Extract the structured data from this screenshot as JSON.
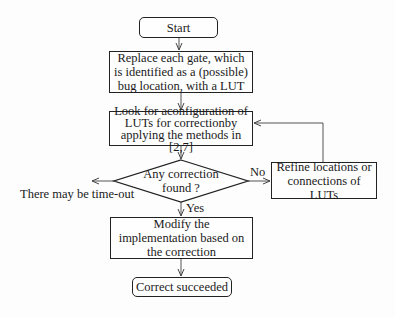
{
  "nodes": {
    "start": {
      "label": "Start",
      "shape": "rounded-rect"
    },
    "replace": {
      "label": "Replace each gate, which is identified as a (possible) bug location, with a LUT",
      "shape": "rect"
    },
    "look": {
      "label": "Look for aconfiguration of LUTs for correctionby applying the methods in [2,7]",
      "shape": "rect"
    },
    "decision": {
      "label": "Any correction found ?",
      "shape": "diamond"
    },
    "refine": {
      "label": "Refine locations or connections of LUTs",
      "shape": "rect"
    },
    "modify": {
      "label": "Modify the implementation based on the correction",
      "shape": "rect"
    },
    "end": {
      "label": "Correct succeeded",
      "shape": "rounded-rect"
    }
  },
  "edge_labels": {
    "no": "No",
    "yes": "Yes",
    "timeout": "There may be time-out"
  },
  "colors": {
    "stroke": "#222222",
    "background": "#fdfdfd"
  }
}
